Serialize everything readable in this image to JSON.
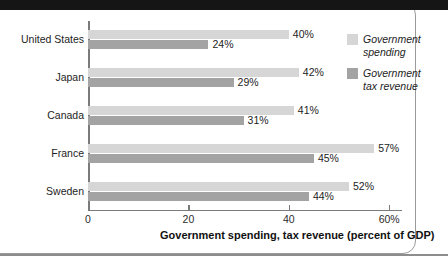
{
  "figure": {
    "background_color": "#ffffff",
    "top_band_color": "#151515",
    "frame_color": "#9a9a9a"
  },
  "legend": {
    "position": "right",
    "items": [
      {
        "label_line1": "Government",
        "label_line2": "spending",
        "color": "#d6d6d6",
        "swatch_name": "legend-swatch-spending"
      },
      {
        "label_line1": "Government",
        "label_line2": "tax revenue",
        "color": "#a3a3a3",
        "swatch_name": "legend-swatch-revenue"
      }
    ]
  },
  "axis": {
    "title": "Government spending, tax revenue (percent of GDP)",
    "ticks": [
      {
        "value": 0,
        "label": "0"
      },
      {
        "value": 20,
        "label": "20"
      },
      {
        "value": 40,
        "label": "40"
      },
      {
        "value": 60,
        "label": "60%"
      }
    ]
  },
  "rows": [
    {
      "category": "United States",
      "spending": {
        "value": 40,
        "label": "40%"
      },
      "revenue": {
        "value": 24,
        "label": "24%"
      }
    },
    {
      "category": "Japan",
      "spending": {
        "value": 42,
        "label": "42%"
      },
      "revenue": {
        "value": 29,
        "label": "29%"
      }
    },
    {
      "category": "Canada",
      "spending": {
        "value": 41,
        "label": "41%"
      },
      "revenue": {
        "value": 31,
        "label": "31%"
      }
    },
    {
      "category": "France",
      "spending": {
        "value": 57,
        "label": "57%"
      },
      "revenue": {
        "value": 45,
        "label": "45%"
      }
    },
    {
      "category": "Sweden",
      "spending": {
        "value": 52,
        "label": "52%"
      },
      "revenue": {
        "value": 44,
        "label": "44%"
      }
    }
  ],
  "chart_data": {
    "type": "bar",
    "orientation": "horizontal",
    "title": "",
    "subtitle": "",
    "xlabel": "Government spending, tax revenue (percent of GDP)",
    "ylabel": "",
    "categories": [
      "United States",
      "Japan",
      "Canada",
      "France",
      "Sweden"
    ],
    "series": [
      {
        "name": "Government spending",
        "values": [
          40,
          42,
          41,
          57,
          52
        ],
        "color": "#d6d6d6"
      },
      {
        "name": "Government tax revenue",
        "values": [
          24,
          29,
          31,
          45,
          44
        ],
        "color": "#a3a3a3"
      }
    ],
    "data_labels": {
      "Government spending": [
        "40%",
        "42%",
        "41%",
        "57%",
        "52%"
      ],
      "Government tax revenue": [
        "24%",
        "29%",
        "31%",
        "45%",
        "44%"
      ]
    },
    "xlim": [
      0,
      63
    ],
    "xticks": [
      0,
      20,
      40,
      60
    ],
    "xtick_labels": [
      "0",
      "20",
      "40",
      "60%"
    ],
    "grid": false,
    "legend_position": "right"
  }
}
